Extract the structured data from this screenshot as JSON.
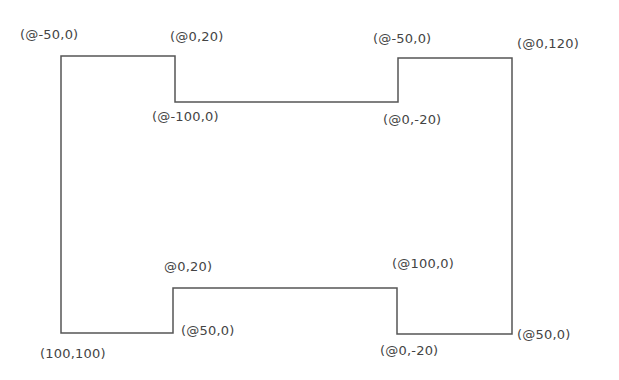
{
  "diagram": {
    "stroke_color": "#555555",
    "vertices": [
      [
        61,
        56
      ],
      [
        175,
        56
      ],
      [
        175,
        102
      ],
      [
        398,
        102
      ],
      [
        398,
        58
      ],
      [
        512,
        58
      ],
      [
        512,
        334
      ],
      [
        397,
        334
      ],
      [
        397,
        288
      ],
      [
        173,
        288
      ],
      [
        173,
        333
      ],
      [
        61,
        333
      ]
    ],
    "labels": [
      {
        "id": "label-start-top-left",
        "text": "(@-50,0)",
        "x": 20,
        "y": 27
      },
      {
        "id": "label-top-notch-left",
        "text": "(@0,20)",
        "x": 170,
        "y": 29
      },
      {
        "id": "label-top-notch-bottom-left",
        "text": "(@-100,0)",
        "x": 152,
        "y": 109
      },
      {
        "id": "label-top-notch-right",
        "text": "(@-50,0)",
        "x": 373,
        "y": 31
      },
      {
        "id": "label-top-right",
        "text": "(@0,120)",
        "x": 517,
        "y": 36
      },
      {
        "id": "label-top-notch-bottom-right",
        "text": "(@0,-20)",
        "x": 383,
        "y": 112
      },
      {
        "id": "label-bottom-notch-left",
        "text": "@0,20)",
        "x": 164,
        "y": 259
      },
      {
        "id": "label-bottom-notch-right",
        "text": "(@100,0)",
        "x": 392,
        "y": 256
      },
      {
        "id": "label-bottom-left-start",
        "text": "(100,100)",
        "x": 40,
        "y": 346
      },
      {
        "id": "label-bottom-notch-corner-left",
        "text": "(@50,0)",
        "x": 181,
        "y": 323
      },
      {
        "id": "label-bottom-notch-corner-right",
        "text": "(@0,-20)",
        "x": 380,
        "y": 343
      },
      {
        "id": "label-bottom-right",
        "text": "(@50,0)",
        "x": 517,
        "y": 327
      }
    ]
  }
}
